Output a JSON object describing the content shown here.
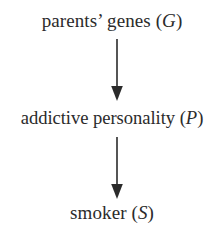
{
  "diagram": {
    "type": "causal-chain",
    "orientation": "vertical",
    "background_color": "#ffffff",
    "text_color": "#2b2b2b",
    "nodes": [
      {
        "id": "genes",
        "text_prefix": "parents’ genes (",
        "variable": "G",
        "text_suffix": ")",
        "full_text": "parents’ genes (G)"
      },
      {
        "id": "personality",
        "text_prefix": "addictive personality (",
        "variable": "P",
        "text_suffix": ")",
        "full_text": "addictive personality (P)"
      },
      {
        "id": "smoker",
        "text_prefix": "smoker (",
        "variable": "S",
        "text_suffix": ")",
        "full_text": "smoker (S)"
      }
    ],
    "edges": [
      {
        "id": "genes-to-personality",
        "from": "genes",
        "to": "personality",
        "style": "solid-arrow-down"
      },
      {
        "id": "personality-to-smoker",
        "from": "personality",
        "to": "smoker",
        "style": "solid-arrow-down"
      }
    ]
  }
}
